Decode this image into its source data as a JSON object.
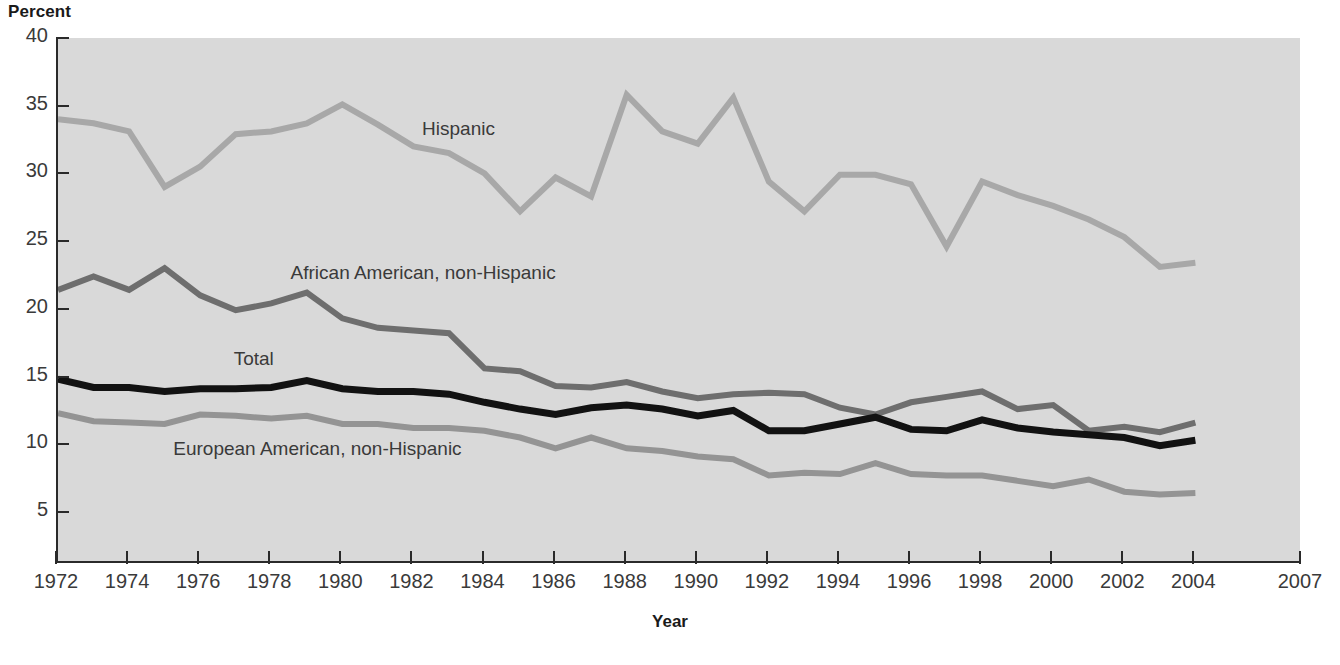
{
  "chart_data": {
    "type": "line",
    "title": "",
    "ylabel": "Percent",
    "xlabel": "Year",
    "xlim": [
      1972,
      2007
    ],
    "ylim": [
      0,
      40
    ],
    "y_ticks": [
      40,
      35,
      30,
      25,
      20,
      15,
      10,
      5
    ],
    "x_ticks": [
      1972,
      1974,
      1976,
      1978,
      1980,
      1982,
      1984,
      1986,
      1988,
      1990,
      1992,
      1994,
      1996,
      1998,
      2000,
      2002,
      2004,
      2007
    ],
    "x": [
      1972,
      1973,
      1974,
      1975,
      1976,
      1977,
      1978,
      1979,
      1980,
      1981,
      1982,
      1983,
      1984,
      1985,
      1986,
      1987,
      1988,
      1989,
      1990,
      1991,
      1992,
      1993,
      1994,
      1995,
      1996,
      1997,
      1998,
      1999,
      2000,
      2001,
      2002,
      2003,
      2004
    ],
    "grid": false,
    "legend_position": "inline-annotations",
    "plot_background": "#d9d9d9",
    "series": [
      {
        "name": "Hispanic",
        "color": "#a8a8a8",
        "label_x": 1982.3,
        "label_y": 33.2,
        "values": [
          34.0,
          33.7,
          33.1,
          29.0,
          30.5,
          32.9,
          33.1,
          33.7,
          35.1,
          33.6,
          32.0,
          31.5,
          30.0,
          27.2,
          29.7,
          28.3,
          35.8,
          33.1,
          32.2,
          35.6,
          29.4,
          27.2,
          29.9,
          29.9,
          29.2,
          24.6,
          29.4,
          28.4,
          27.6,
          26.6,
          25.3,
          23.1,
          23.4
        ]
      },
      {
        "name": "African American, non-Hispanic",
        "color": "#6e6e6e",
        "label_x": 1978.6,
        "label_y": 22.6,
        "values": [
          21.4,
          22.4,
          21.4,
          23.0,
          21.0,
          19.9,
          20.4,
          21.2,
          19.3,
          18.6,
          18.4,
          18.2,
          15.6,
          15.4,
          14.3,
          14.2,
          14.6,
          13.9,
          13.4,
          13.7,
          13.8,
          13.7,
          12.7,
          12.2,
          13.1,
          13.5,
          13.9,
          12.6,
          12.9,
          11.0,
          11.3,
          10.9,
          11.6
        ]
      },
      {
        "name": "Total",
        "color": "#121212",
        "label_x": 1977.0,
        "label_y": 16.2,
        "values": [
          14.8,
          14.2,
          14.2,
          13.9,
          14.1,
          14.1,
          14.2,
          14.7,
          14.1,
          13.9,
          13.9,
          13.7,
          13.1,
          12.6,
          12.2,
          12.7,
          12.9,
          12.6,
          12.1,
          12.5,
          11.0,
          11.0,
          11.5,
          12.0,
          11.1,
          11.0,
          11.8,
          11.2,
          10.9,
          10.7,
          10.5,
          9.9,
          10.3
        ]
      },
      {
        "name": "European American, non-Hispanic",
        "color": "#949494",
        "label_x": 1975.3,
        "label_y": 9.6,
        "values": [
          12.3,
          11.7,
          11.6,
          11.5,
          12.2,
          12.1,
          11.9,
          12.1,
          11.5,
          11.5,
          11.2,
          11.2,
          11.0,
          10.5,
          9.7,
          10.5,
          9.7,
          9.5,
          9.1,
          8.9,
          7.7,
          7.9,
          7.8,
          8.6,
          7.8,
          7.7,
          7.7,
          7.3,
          6.9,
          7.4,
          6.5,
          6.3,
          6.4
        ]
      }
    ]
  }
}
